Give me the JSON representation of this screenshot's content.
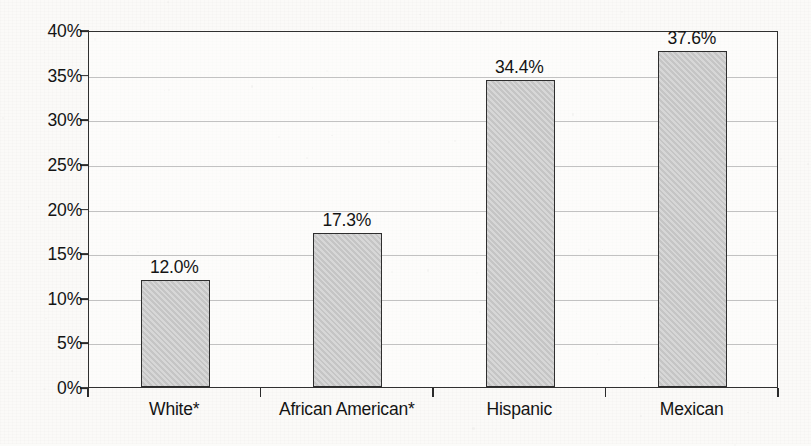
{
  "chart_data": {
    "type": "bar",
    "title": "",
    "subtitle": "",
    "xlabel": "",
    "ylabel": "",
    "categories": [
      "White*",
      "African American*",
      "Hispanic",
      "Mexican"
    ],
    "values": [
      12.0,
      17.3,
      34.4,
      37.6
    ],
    "value_labels": [
      "12.0%",
      "17.3%",
      "34.4%",
      "37.6%"
    ],
    "ylim": [
      0,
      40
    ],
    "ytick_values": [
      0,
      5,
      10,
      15,
      20,
      25,
      30,
      35,
      40
    ],
    "ytick_labels": [
      "0%",
      "5%",
      "10%",
      "15%",
      "20%",
      "25%",
      "30%",
      "35%",
      "40%"
    ],
    "grid": true,
    "legend": null,
    "series": [
      {
        "name": "",
        "values": [
          12.0,
          17.3,
          34.4,
          37.6
        ]
      }
    ],
    "bar_color": "#c9c9c9",
    "bar_border_color": "#2e2e2e",
    "axis_color": "#303030",
    "grid_color": "#c2c2c2",
    "text_color": "#141414"
  }
}
